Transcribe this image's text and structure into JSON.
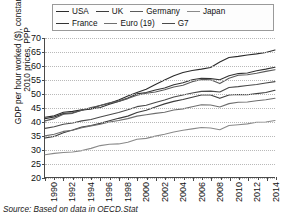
{
  "figure": {
    "source_prefix": "Source: Based on data in ",
    "source_ref": "OECD.Stat"
  },
  "legend": {
    "rows": [
      [
        {
          "label": "USA",
          "color": "#2b2b2b"
        },
        {
          "label": "UK",
          "color": "#3d3d3d"
        },
        {
          "label": "Germany",
          "color": "#5a5a5a"
        },
        {
          "label": "Japan",
          "color": "#8a8a8a"
        }
      ],
      [
        {
          "label": "France",
          "color": "#333333"
        },
        {
          "label": "Euro (19)",
          "color": "#6e6e6e"
        },
        {
          "label": "G7",
          "color": "#4a4a4a"
        }
      ]
    ]
  },
  "axes": {
    "ylabel": "GDP per hour worked ($), constant 2010 prices, PPP",
    "yticks": [
      20,
      25,
      30,
      35,
      40,
      45,
      50,
      55,
      60,
      65,
      70
    ],
    "xticks": [
      1990,
      1992,
      1994,
      1996,
      1998,
      2000,
      2002,
      2004,
      2006,
      2008,
      2010,
      2012,
      2014
    ]
  },
  "chart_data": {
    "type": "line",
    "title": "",
    "xlabel": "",
    "ylabel": "GDP per hour worked ($), constant 2010 prices, PPP",
    "xlim": [
      1990,
      2015
    ],
    "ylim": [
      20,
      70
    ],
    "grid": true,
    "legend_position": "top",
    "x": [
      1990,
      1991,
      1992,
      1993,
      1994,
      1995,
      1996,
      1997,
      1998,
      1999,
      2000,
      2001,
      2002,
      2003,
      2004,
      2005,
      2006,
      2007,
      2008,
      2009,
      2010,
      2011,
      2012,
      2013,
      2014,
      2015
    ],
    "series": [
      {
        "name": "USA",
        "color": "#2b2b2b",
        "values": [
          41.5,
          42.0,
          43.3,
          43.6,
          44.2,
          44.6,
          45.7,
          46.5,
          47.7,
          49.1,
          50.4,
          51.6,
          53.3,
          54.9,
          56.4,
          57.6,
          58.3,
          58.8,
          59.4,
          61.4,
          63.0,
          63.4,
          63.9,
          64.3,
          64.8,
          65.7
        ]
      },
      {
        "name": "France",
        "color": "#333333",
        "values": [
          41.0,
          41.6,
          42.8,
          43.1,
          44.0,
          44.5,
          45.0,
          46.2,
          47.2,
          48.4,
          49.9,
          50.4,
          51.3,
          52.0,
          53.2,
          53.9,
          55.0,
          55.5,
          55.4,
          55.0,
          56.4,
          57.2,
          57.4,
          58.2,
          58.8,
          59.5
        ]
      },
      {
        "name": "Germany",
        "color": "#5a5a5a",
        "values": [
          40.2,
          41.0,
          42.6,
          42.9,
          44.0,
          45.0,
          45.7,
          46.7,
          47.2,
          48.2,
          49.4,
          50.1,
          50.6,
          51.4,
          52.4,
          53.0,
          54.3,
          55.1,
          55.0,
          53.6,
          55.5,
          56.6,
          56.8,
          57.3,
          58.0,
          58.6
        ]
      },
      {
        "name": "G7",
        "color": "#4a4a4a",
        "values": [
          37.5,
          38.1,
          39.0,
          39.4,
          40.2,
          40.7,
          41.6,
          42.4,
          43.2,
          44.2,
          45.3,
          45.8,
          46.8,
          47.7,
          48.8,
          49.5,
          50.2,
          50.8,
          50.9,
          50.6,
          52.2,
          52.5,
          52.9,
          53.3,
          53.8,
          54.3
        ]
      },
      {
        "name": "UK",
        "color": "#3d3d3d",
        "values": [
          34.0,
          34.6,
          35.9,
          36.9,
          38.0,
          38.5,
          39.3,
          40.2,
          41.1,
          41.9,
          43.2,
          44.0,
          45.2,
          46.3,
          47.2,
          47.9,
          48.7,
          49.5,
          49.5,
          48.3,
          49.5,
          49.7,
          49.6,
          50.0,
          50.4,
          51.2
        ]
      },
      {
        "name": "Euro (19)",
        "color": "#6e6e6e",
        "values": [
          34.8,
          35.4,
          36.4,
          36.8,
          37.7,
          38.4,
          39.0,
          39.8,
          40.3,
          41.0,
          41.9,
          42.4,
          42.9,
          43.3,
          44.1,
          44.5,
          45.3,
          46.0,
          45.9,
          45.2,
          46.4,
          46.9,
          47.0,
          47.4,
          47.8,
          48.3
        ]
      },
      {
        "name": "Japan",
        "color": "#8a8a8a",
        "values": [
          28.0,
          28.5,
          28.8,
          29.0,
          29.5,
          30.3,
          31.3,
          31.8,
          31.9,
          32.5,
          33.6,
          33.9,
          34.7,
          35.4,
          36.2,
          36.8,
          37.3,
          37.8,
          37.6,
          37.0,
          38.5,
          38.8,
          39.1,
          39.7,
          39.8,
          40.3
        ]
      }
    ]
  }
}
